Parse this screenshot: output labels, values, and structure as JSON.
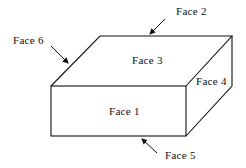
{
  "diagram": {
    "title": "",
    "type": "box-faces",
    "labels": {
      "face1": "Face 1",
      "face2": "Face 2",
      "face3": "Face 3",
      "face4": "Face 4",
      "face5": "Face 5",
      "face6": "Face 6"
    },
    "colors": {
      "stroke": "#111111",
      "background": "#ffffff"
    }
  }
}
